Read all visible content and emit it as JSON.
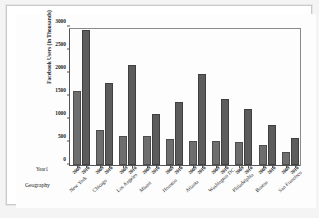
{
  "chart_data": {
    "type": "bar",
    "title": "",
    "xlabel": "Geography",
    "ylabel": "Facebook Users (in Thousands)",
    "ylim": [
      0,
      3000
    ],
    "yticks": [
      0,
      500,
      1000,
      1500,
      2000,
      2500,
      3000
    ],
    "grid": false,
    "legend_position": "none",
    "categories": [
      "New York",
      "Chicago",
      "Los Angeles",
      "Miami",
      "Houston",
      "Atlanta",
      "Washington DC",
      "Philadelphia",
      "Boston",
      "San Francisco"
    ],
    "series": [
      {
        "name": "2009",
        "color": "#6e6e6e",
        "values": [
          1615,
          770,
          625,
          620,
          555,
          530,
          515,
          510,
          445,
          285
        ]
      },
      {
        "name": "2010",
        "color": "#5c5c5c",
        "values": [
          2930,
          1790,
          2165,
          1115,
          1370,
          1985,
          1445,
          1210,
          875,
          595
        ]
      }
    ]
  },
  "axes": {
    "year_caption": "Year1",
    "geography_caption": "Geography",
    "year_labels": [
      "2009",
      "2010"
    ]
  }
}
